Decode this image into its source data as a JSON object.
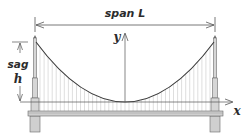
{
  "diagram": {
    "span_label": "span L",
    "sag_label": "sag",
    "sag_symbol": "h",
    "x_axis_label": "x",
    "y_axis_label": "y",
    "colors": {
      "background": "#ffffff",
      "line": "#555555",
      "cable": "#3a3a3a",
      "hanger": "#b8b8b8",
      "tower_fill": "#d6d6d6",
      "tower_stroke": "#6a6a6a",
      "deck_fill": "#cfcfcf",
      "text": "#2b2b2b"
    },
    "geometry": {
      "left_tower_x": 35,
      "right_tower_x": 215,
      "tower_top_y": 38,
      "cable_end_y": 42,
      "cable_vertex": [
        125,
        102
      ],
      "deck_y": 111,
      "hanger_count": 44
    }
  }
}
